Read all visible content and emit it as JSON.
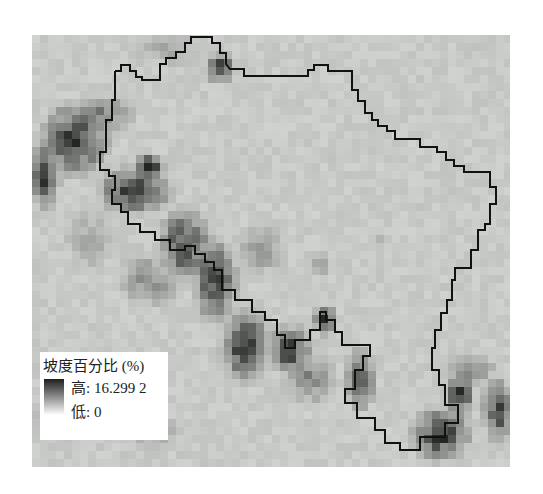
{
  "map": {
    "title": "",
    "raster_variable": "坡度百分比 (%)",
    "raster_extent_px": {
      "left": 32,
      "top": 35,
      "right": 510,
      "bottom": 467
    },
    "cell_size_px": 8,
    "base_color": "#dcdfdc",
    "boundary_color": "#111111",
    "boundary_points": [
      [
        115,
        71
      ],
      [
        121,
        71
      ],
      [
        121,
        65
      ],
      [
        130,
        65
      ],
      [
        130,
        71
      ],
      [
        136,
        71
      ],
      [
        136,
        77
      ],
      [
        142,
        77
      ],
      [
        142,
        80
      ],
      [
        160,
        80
      ],
      [
        160,
        64
      ],
      [
        166,
        64
      ],
      [
        166,
        58
      ],
      [
        176,
        58
      ],
      [
        176,
        52
      ],
      [
        185,
        52
      ],
      [
        185,
        43
      ],
      [
        191,
        43
      ],
      [
        191,
        37
      ],
      [
        212,
        37
      ],
      [
        212,
        43
      ],
      [
        220,
        43
      ],
      [
        220,
        53
      ],
      [
        226,
        53
      ],
      [
        226,
        64
      ],
      [
        230,
        69
      ],
      [
        244,
        69
      ],
      [
        244,
        76
      ],
      [
        308,
        76
      ],
      [
        308,
        70
      ],
      [
        314,
        70
      ],
      [
        314,
        65
      ],
      [
        328,
        65
      ],
      [
        328,
        71
      ],
      [
        352,
        71
      ],
      [
        352,
        90
      ],
      [
        358,
        90
      ],
      [
        358,
        101
      ],
      [
        365,
        101
      ],
      [
        365,
        113
      ],
      [
        372,
        113
      ],
      [
        372,
        120
      ],
      [
        378,
        120
      ],
      [
        378,
        126
      ],
      [
        387,
        126
      ],
      [
        387,
        131
      ],
      [
        395,
        131
      ],
      [
        395,
        139
      ],
      [
        420,
        139
      ],
      [
        420,
        147
      ],
      [
        437,
        147
      ],
      [
        437,
        152
      ],
      [
        446,
        152
      ],
      [
        446,
        160
      ],
      [
        454,
        160
      ],
      [
        454,
        166
      ],
      [
        464,
        166
      ],
      [
        464,
        172
      ],
      [
        490,
        172
      ],
      [
        490,
        187
      ],
      [
        496,
        187
      ],
      [
        496,
        204
      ],
      [
        490,
        204
      ],
      [
        490,
        224
      ],
      [
        485,
        224
      ],
      [
        485,
        230
      ],
      [
        478,
        230
      ],
      [
        478,
        250
      ],
      [
        471,
        250
      ],
      [
        471,
        268
      ],
      [
        455,
        268
      ],
      [
        455,
        280
      ],
      [
        452,
        280
      ],
      [
        452,
        300
      ],
      [
        447,
        300
      ],
      [
        447,
        313
      ],
      [
        441,
        313
      ],
      [
        441,
        330
      ],
      [
        435,
        330
      ],
      [
        435,
        348
      ],
      [
        432,
        348
      ],
      [
        432,
        370
      ],
      [
        439,
        370
      ],
      [
        439,
        385
      ],
      [
        445,
        385
      ],
      [
        445,
        405
      ],
      [
        458,
        405
      ],
      [
        458,
        423
      ],
      [
        445,
        423
      ],
      [
        445,
        437
      ],
      [
        420,
        437
      ],
      [
        420,
        450
      ],
      [
        400,
        450
      ],
      [
        400,
        443
      ],
      [
        385,
        443
      ],
      [
        385,
        430
      ],
      [
        375,
        430
      ],
      [
        375,
        418
      ],
      [
        357,
        418
      ],
      [
        357,
        403
      ],
      [
        345,
        403
      ],
      [
        345,
        389
      ],
      [
        355,
        389
      ],
      [
        355,
        370
      ],
      [
        363,
        370
      ],
      [
        363,
        356
      ],
      [
        370,
        356
      ],
      [
        370,
        345
      ],
      [
        342,
        345
      ],
      [
        342,
        332
      ],
      [
        335,
        332
      ],
      [
        335,
        320
      ],
      [
        326,
        320
      ],
      [
        326,
        312
      ],
      [
        320,
        312
      ],
      [
        320,
        330
      ],
      [
        310,
        330
      ],
      [
        310,
        340
      ],
      [
        295,
        340
      ],
      [
        295,
        348
      ],
      [
        285,
        348
      ],
      [
        285,
        335
      ],
      [
        277,
        335
      ],
      [
        277,
        320
      ],
      [
        265,
        320
      ],
      [
        265,
        312
      ],
      [
        252,
        312
      ],
      [
        252,
        300
      ],
      [
        235,
        300
      ],
      [
        235,
        290
      ],
      [
        222,
        290
      ],
      [
        222,
        270
      ],
      [
        214,
        270
      ],
      [
        214,
        262
      ],
      [
        205,
        262
      ],
      [
        205,
        254
      ],
      [
        195,
        254
      ],
      [
        195,
        246
      ],
      [
        185,
        246
      ],
      [
        185,
        250
      ],
      [
        170,
        250
      ],
      [
        170,
        240
      ],
      [
        155,
        240
      ],
      [
        155,
        232
      ],
      [
        140,
        232
      ],
      [
        140,
        224
      ],
      [
        128,
        224
      ],
      [
        128,
        212
      ],
      [
        121,
        212
      ],
      [
        121,
        204
      ],
      [
        112,
        204
      ],
      [
        112,
        190
      ],
      [
        115,
        190
      ],
      [
        115,
        176
      ],
      [
        109,
        176
      ],
      [
        109,
        170
      ],
      [
        100,
        170
      ],
      [
        100,
        152
      ],
      [
        106,
        152
      ],
      [
        106,
        120
      ],
      [
        112,
        120
      ],
      [
        112,
        100
      ],
      [
        115,
        100
      ]
    ],
    "dark_zones": [
      {
        "cx": 220,
        "cy": 68,
        "rx": 12,
        "ry": 12,
        "intensity": 0.95
      },
      {
        "cx": 75,
        "cy": 140,
        "rx": 28,
        "ry": 30,
        "intensity": 0.9
      },
      {
        "cx": 45,
        "cy": 175,
        "rx": 12,
        "ry": 28,
        "intensity": 0.85
      },
      {
        "cx": 135,
        "cy": 190,
        "rx": 30,
        "ry": 20,
        "intensity": 0.9
      },
      {
        "cx": 150,
        "cy": 168,
        "rx": 12,
        "ry": 12,
        "intensity": 0.95
      },
      {
        "cx": 100,
        "cy": 115,
        "rx": 30,
        "ry": 18,
        "intensity": 0.55
      },
      {
        "cx": 185,
        "cy": 245,
        "rx": 22,
        "ry": 30,
        "intensity": 0.85
      },
      {
        "cx": 215,
        "cy": 280,
        "rx": 18,
        "ry": 35,
        "intensity": 0.85
      },
      {
        "cx": 150,
        "cy": 280,
        "rx": 30,
        "ry": 25,
        "intensity": 0.45
      },
      {
        "cx": 245,
        "cy": 345,
        "rx": 20,
        "ry": 30,
        "intensity": 0.9
      },
      {
        "cx": 290,
        "cy": 350,
        "rx": 20,
        "ry": 20,
        "intensity": 0.85
      },
      {
        "cx": 325,
        "cy": 320,
        "rx": 10,
        "ry": 12,
        "intensity": 0.9
      },
      {
        "cx": 360,
        "cy": 380,
        "rx": 12,
        "ry": 25,
        "intensity": 0.85
      },
      {
        "cx": 310,
        "cy": 380,
        "rx": 25,
        "ry": 22,
        "intensity": 0.5
      },
      {
        "cx": 440,
        "cy": 435,
        "rx": 25,
        "ry": 22,
        "intensity": 0.9
      },
      {
        "cx": 460,
        "cy": 395,
        "rx": 12,
        "ry": 20,
        "intensity": 0.85
      },
      {
        "cx": 498,
        "cy": 410,
        "rx": 14,
        "ry": 25,
        "intensity": 0.85
      },
      {
        "cx": 470,
        "cy": 370,
        "rx": 25,
        "ry": 15,
        "intensity": 0.45
      },
      {
        "cx": 260,
        "cy": 250,
        "rx": 25,
        "ry": 25,
        "intensity": 0.4
      },
      {
        "cx": 320,
        "cy": 265,
        "rx": 12,
        "ry": 12,
        "intensity": 0.35
      },
      {
        "cx": 90,
        "cy": 240,
        "rx": 25,
        "ry": 30,
        "intensity": 0.35
      },
      {
        "cx": 60,
        "cy": 420,
        "rx": 30,
        "ry": 20,
        "intensity": 0.4
      },
      {
        "cx": 150,
        "cy": 430,
        "rx": 30,
        "ry": 20,
        "intensity": 0.35
      },
      {
        "cx": 170,
        "cy": 50,
        "rx": 40,
        "ry": 18,
        "intensity": 0.3
      },
      {
        "cx": 380,
        "cy": 240,
        "rx": 15,
        "ry": 10,
        "intensity": 0.2
      }
    ]
  },
  "legend": {
    "title": "坡度百分比 (%)",
    "high_label": "高: 16.299 2",
    "low_label": "低: 0",
    "ramp_high_color": "#1e1e1e",
    "ramp_low_color": "#ffffff"
  }
}
